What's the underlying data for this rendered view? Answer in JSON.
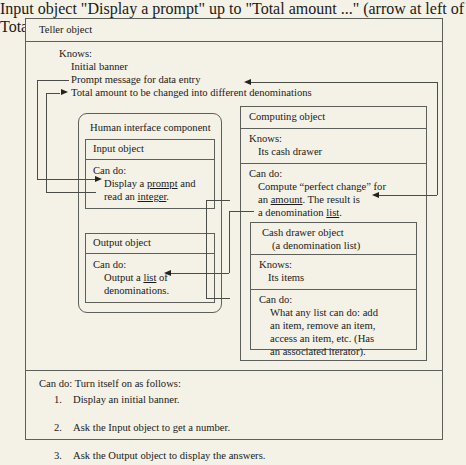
{
  "diagram": {
    "background_color": "#f4f1e6",
    "line_color": "#5d5f5a"
  },
  "teller": {
    "title": "Teller object",
    "knows_label": "Knows:",
    "knows_items": [
      "Initial banner",
      "Prompt message for data entry",
      "Total amount to be changed into different denominations"
    ],
    "candu_label": "Can do: Turn itself on as follows:",
    "steps": [
      {
        "num": "1.",
        "text": "Display an initial banner."
      },
      {
        "num": "2.",
        "text": "Ask the Input object to get a number."
      },
      {
        "num": "3.",
        "text": "Ask the Output object to display the answers."
      }
    ]
  },
  "human_interface": {
    "title": "Human interface component"
  },
  "input_object": {
    "title": "Input object",
    "candu_label": "Can do:",
    "line1_a": "Display a ",
    "line1_u": "prompt",
    "line1_b": " and",
    "line2_a": "read an ",
    "line2_u": "integer",
    "line2_b": "."
  },
  "output_object": {
    "title": "Output object",
    "candu_label": "Can do:",
    "line1_a": "Output a ",
    "line1_u": "list",
    "line1_b": " of",
    "line2": "denominations."
  },
  "computing_object": {
    "title": "Computing object",
    "knows_label": "Knows:",
    "knows_item": "Its cash drawer",
    "candu_label": "Can do:",
    "line1": "Compute “perfect change” for",
    "line2_a": "an ",
    "line2_u": "amount",
    "line2_b": ". The result is",
    "line3_a": "a denomination ",
    "line3_u": "list",
    "line3_b": "."
  },
  "cash_drawer": {
    "title": "Cash drawer object",
    "subtitle": "(a denomination list)",
    "knows_label": "Knows:",
    "knows_item": "Its items",
    "candu_label": "Can do:",
    "line1": "What any list can do: add",
    "line2": "an item, remove an item,",
    "line3": "access an item, etc. (Has",
    "line4": "an associated iterator)."
  },
  "icons": {
    "arrow_right": "arrow-right-icon",
    "arrow_left": "arrow-left-icon"
  }
}
